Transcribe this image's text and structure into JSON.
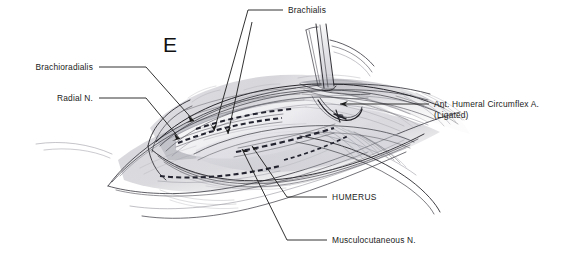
{
  "figure": {
    "panel_letter": "E",
    "background_color": "#ffffff",
    "ink_color": "#1b1b1b",
    "style": "graphite pencil anatomical illustration"
  },
  "annotations": [
    {
      "id": "brachioradialis",
      "label": "Brachioradialis",
      "align": "right",
      "text_x": 93,
      "text_y": 70,
      "leader": "M 99,67 L 146,67 L 194,121",
      "arrow_x": 194,
      "arrow_y": 121,
      "arrow_angle": 49
    },
    {
      "id": "radial-nerve",
      "label": "Radial N.",
      "align": "right",
      "text_x": 93,
      "text_y": 101,
      "leader": "M 99,98 L 146,98 L 180,139",
      "arrow_x": 180,
      "arrow_y": 139,
      "arrow_angle": 50
    },
    {
      "id": "brachialis",
      "label": "Brachialis",
      "align": "left",
      "text_x": 288,
      "text_y": 13,
      "leader": "M 283,10 L 248,10 L 214,131",
      "arrow_x": 214,
      "arrow_y": 131,
      "arrow_angle": 106
    },
    {
      "id": "ant-humeral-circumflex",
      "label": "Ant. Humeral Circumflex A.",
      "label_line2": "(Ligated)",
      "align": "left",
      "text_x": 434,
      "text_y": 107,
      "text_y2": 118,
      "leader": "M 429,104 L 340,104",
      "arrow_x": 340,
      "arrow_y": 104,
      "arrow_angle": 180
    },
    {
      "id": "humerus",
      "label": "HUMERUS",
      "align": "left",
      "text_x": 332,
      "text_y": 200,
      "leader": "M 327,197 L 287,197 L 252,146",
      "arrow_x": 252,
      "arrow_y": 146,
      "arrow_angle": 304
    },
    {
      "id": "musculocutaneous-nerve",
      "label": "Musculocutaneous N.",
      "align": "left",
      "text_x": 332,
      "text_y": 243,
      "leader": "M 327,240 L 287,240 L 242,149",
      "arrow_x": 242,
      "arrow_y": 149,
      "arrow_angle": 296
    }
  ]
}
